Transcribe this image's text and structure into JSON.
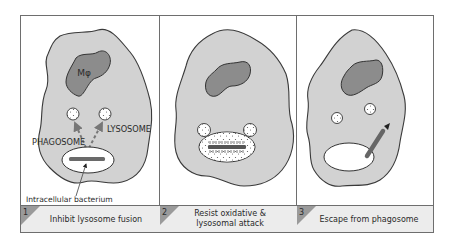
{
  "colors": {
    "frame": "#6e6e6e",
    "cell_fill": "#d2d2d2",
    "cell_stroke": "#3a3a3a",
    "nucleus_fill": "#8c8c8c",
    "vesicle_fill": "#ffffff",
    "bacterium": "#6a6a6a",
    "caption_bg": "#ececec",
    "tab_fill": "#9a9a9a",
    "text": "#2a2a2a"
  },
  "panels": [
    {
      "number": "1",
      "caption_lines": [
        "Inhibit lysosome fusion"
      ],
      "labels": {
        "nucleus": "Mφ",
        "phagosome": "PHAGOSOME",
        "lysosome": "LYSOSOME",
        "bacterium": "Intracellular bacterium"
      }
    },
    {
      "number": "2",
      "caption_lines": [
        "Resist oxidative &",
        "lysosomal attack"
      ]
    },
    {
      "number": "3",
      "caption_lines": [
        "Escape from phagosome"
      ]
    }
  ]
}
